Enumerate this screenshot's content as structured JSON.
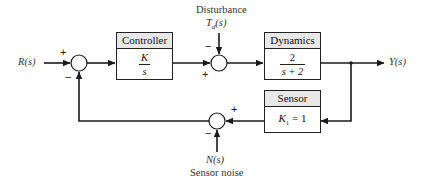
{
  "diagram": {
    "type": "feedback-control-block-diagram",
    "input_label": "R(s)",
    "output_label": "Y(s)",
    "disturbance": {
      "caption": "Disturbance",
      "symbol": "T",
      "subscript": "d",
      "arg": "(s)"
    },
    "noise": {
      "symbol": "N(s)",
      "caption": "Sensor noise"
    },
    "blocks": {
      "controller": {
        "title": "Controller",
        "numerator": "K",
        "denominator": "s"
      },
      "dynamics": {
        "title": "Dynamics",
        "numerator": "2",
        "denominator": "s + 2"
      },
      "sensor": {
        "title": "Sensor",
        "gain_symbol": "K",
        "gain_subscript": "1",
        "gain_value": "= 1"
      }
    },
    "summing_junctions": {
      "input": {
        "plus": "+",
        "minus": "−"
      },
      "disturbance": {
        "plus": "+",
        "minus": "−"
      },
      "noise": {
        "plus": "+",
        "minus": "−"
      }
    },
    "colors": {
      "line": "#1a1a1a",
      "header_fill": "#e8e8e8",
      "text": "#333333"
    }
  }
}
